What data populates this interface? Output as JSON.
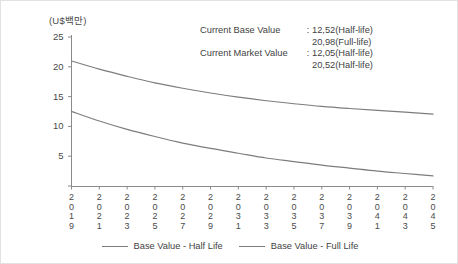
{
  "chart_data": {
    "type": "line",
    "title": "",
    "subtitle": "",
    "xlabel": "",
    "ylabel": "(U$백만)",
    "ylim": [
      0,
      25
    ],
    "yticks": [
      "0",
      "5",
      "10",
      "15",
      "20",
      "25"
    ],
    "grid": false,
    "legend_position": "bottom-center",
    "x": [
      "2019",
      "2021",
      "2023",
      "2025",
      "2027",
      "2029",
      "2031",
      "2033",
      "2035",
      "2037",
      "2039",
      "2041",
      "2043",
      "2045"
    ],
    "series": [
      {
        "name": "Base Value - Full Life",
        "color": "#7d7d7d",
        "values": [
          20.98,
          19.6,
          18.4,
          17.3,
          16.4,
          15.6,
          14.9,
          14.3,
          13.8,
          13.35,
          13.0,
          12.7,
          12.4,
          12.05
        ]
      },
      {
        "name": "Base Value - Half Life",
        "color": "#7d7d7d",
        "values": [
          12.52,
          10.9,
          9.5,
          8.3,
          7.2,
          6.3,
          5.5,
          4.7,
          4.1,
          3.5,
          3.0,
          2.5,
          2.1,
          1.7
        ]
      }
    ],
    "annotations": [
      {
        "label": "Current  Base Value",
        "separator": ":",
        "values": [
          "12,52(Half-life)",
          "20,98(Full-life)"
        ]
      },
      {
        "label": "Current Market Value",
        "separator": ":",
        "values": [
          "12,05(Half-life)",
          "20,52(Half-life)"
        ]
      }
    ],
    "legend": [
      {
        "label": "Base Value - Half Life",
        "color": "#7d7d7d"
      },
      {
        "label": "Base Value - Full Life",
        "color": "#7d7d7d"
      }
    ]
  },
  "axis": {
    "unit_label": "(U$백만)",
    "axis_color": "#8a8a8a"
  }
}
